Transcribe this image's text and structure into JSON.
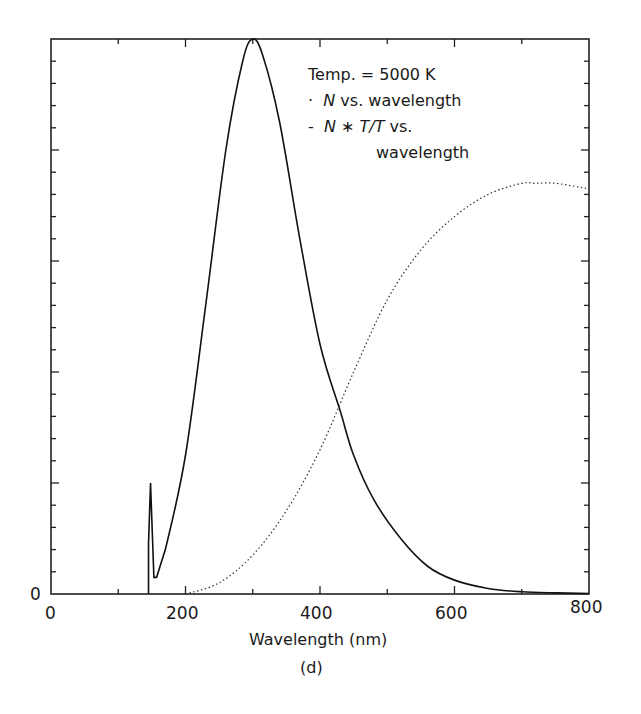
{
  "chart_data": {
    "type": "line",
    "title": "",
    "xlabel": "Wavelength (nm)",
    "ylabel": "",
    "caption": "(d)",
    "xlim": [
      0,
      800
    ],
    "ylim": [
      0,
      1
    ],
    "x_ticks": [
      "0",
      "200",
      "400",
      "600",
      "800"
    ],
    "y_ticks": [
      "0"
    ],
    "grid": false,
    "legend": {
      "position": "upper right (inside)",
      "header": "Temp. = 5000 K",
      "entries": [
        {
          "marker": "·",
          "name_italic": "N",
          "name_rest": " vs. wavelength",
          "style": "dotted"
        },
        {
          "marker": "-",
          "name_italic": "N * T/T",
          "name_rest": " vs.",
          "name_cont": "wavelength",
          "style": "solid"
        }
      ]
    },
    "series": [
      {
        "name": "N * T/T vs. wavelength",
        "style": "solid",
        "x": [
          145,
          145,
          148,
          153,
          157,
          170,
          200,
          230,
          260,
          285,
          300,
          315,
          340,
          370,
          400,
          430,
          450,
          480,
          520,
          560,
          600,
          650,
          700,
          750,
          800
        ],
        "y": [
          0,
          0.09,
          0.2,
          0.03,
          0.03,
          0.08,
          0.25,
          0.52,
          0.8,
          0.96,
          1.0,
          0.97,
          0.85,
          0.64,
          0.45,
          0.33,
          0.25,
          0.17,
          0.1,
          0.05,
          0.025,
          0.01,
          0.004,
          0.002,
          0.001
        ]
      },
      {
        "name": "N vs. wavelength",
        "style": "dotted",
        "x": [
          200,
          250,
          300,
          350,
          400,
          450,
          500,
          550,
          600,
          650,
          700,
          720,
          750,
          800
        ],
        "y": [
          0,
          0.02,
          0.07,
          0.15,
          0.26,
          0.4,
          0.53,
          0.62,
          0.68,
          0.72,
          0.74,
          0.74,
          0.74,
          0.73
        ]
      }
    ]
  },
  "axes": {
    "x_tick_labels": [
      "0",
      "200",
      "400",
      "600",
      "800"
    ],
    "y_zero_label": "0",
    "xlabel": "Wavelength (nm)",
    "caption": "(d)"
  },
  "legend": {
    "header": "Temp. = 5000 K",
    "line1_marker": "·",
    "line1_italic": "N",
    "line1_rest": " vs. wavelength",
    "line2_marker": "-",
    "line2_italic": "N ∗ T/T",
    "line2_rest": " vs.",
    "line3": "wavelength"
  }
}
